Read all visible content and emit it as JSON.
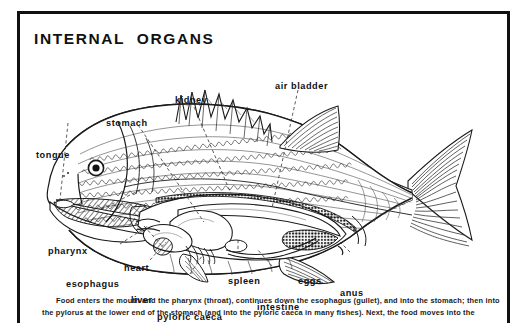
{
  "figure": {
    "title": "INTERNAL  ORGANS",
    "frame_color": "#111111",
    "background_color": "#ffffff",
    "ink_color": "#111111"
  },
  "labels": [
    {
      "id": "tongue",
      "text": "tongue",
      "x": 16,
      "y": 100
    },
    {
      "id": "stomach",
      "text": "stomach",
      "x": 86,
      "y": 68
    },
    {
      "id": "kidney",
      "text": "kidney",
      "x": 155,
      "y": 45
    },
    {
      "id": "air-bladder",
      "text": "air  bladder",
      "x": 255,
      "y": 31
    },
    {
      "id": "pharynx",
      "text": "pharynx",
      "x": 28,
      "y": 196
    },
    {
      "id": "heart",
      "text": "heart",
      "x": 104,
      "y": 213
    },
    {
      "id": "esophagus",
      "text": "esophagus",
      "x": 46,
      "y": 229
    },
    {
      "id": "liver",
      "text": "liver",
      "x": 111,
      "y": 245
    },
    {
      "id": "pyloric-caeca",
      "text": "pyloric  caeca",
      "x": 137,
      "y": 262
    },
    {
      "id": "spleen",
      "text": "spleen",
      "x": 208,
      "y": 226
    },
    {
      "id": "intestine",
      "text": "intestine",
      "x": 237,
      "y": 252
    },
    {
      "id": "eggs",
      "text": "eggs",
      "x": 278,
      "y": 226
    },
    {
      "id": "anus",
      "text": "anus",
      "x": 320,
      "y": 238
    }
  ],
  "caption": {
    "lines": [
      "Food enters the mouth and the pharynx (throat), continues down the esophagus (gullet), and into the stomach; then into",
      "the pylorus at the lower end of the stomach (and into the pyloric caeca in many fishes).  Next, the food moves into the"
    ]
  }
}
